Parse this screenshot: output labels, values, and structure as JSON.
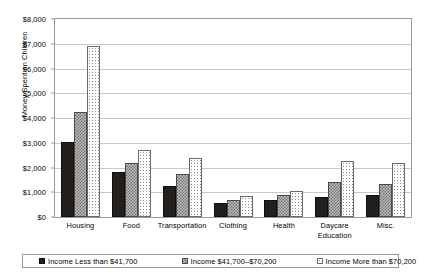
{
  "chart_data": {
    "type": "bar",
    "title": "",
    "xlabel": "",
    "ylabel": "Money Spent on Children",
    "ylim": [
      0,
      8000
    ],
    "ytick_labels": [
      "$8,000",
      "$7,000",
      "$6,000",
      "$5,000",
      "$4,000",
      "$3,000",
      "$2,000",
      "$1,000",
      "$0"
    ],
    "ytick_values": [
      8000,
      7000,
      6000,
      5000,
      4000,
      3000,
      2000,
      1000,
      0
    ],
    "grid": true,
    "legend_position": "bottom",
    "categories": [
      "Housing",
      "Food",
      "Transportation",
      "Clothing",
      "Health",
      "Daycare Education",
      "Misc."
    ],
    "category_labels": [
      [
        "Housing"
      ],
      [
        "Food"
      ],
      [
        "Transportation"
      ],
      [
        "Clothing"
      ],
      [
        "Health"
      ],
      [
        "Daycare",
        "Education"
      ],
      [
        "Misc."
      ]
    ],
    "series": [
      {
        "name": "Income Less than $41,700",
        "fill": "solid-black",
        "color": "#231f1c",
        "values": [
          3050,
          1800,
          1270,
          550,
          700,
          800,
          880
        ]
      },
      {
        "name": "Income $41,700–$70,200",
        "fill": "cross-hatch-gray",
        "color": "#b9b9b9",
        "values": [
          4250,
          2170,
          1750,
          670,
          900,
          1400,
          1330
        ]
      },
      {
        "name": "Income More than $70,200",
        "fill": "dotted-white",
        "color": "#fdfdfd",
        "values": [
          6900,
          2700,
          2380,
          850,
          1050,
          2280,
          2190
        ]
      }
    ]
  },
  "legend": {
    "items": [
      {
        "label": "Income Less than $41,700"
      },
      {
        "label": "Income $41,700–$70,200"
      },
      {
        "label": "Income More than $70,200"
      }
    ]
  }
}
